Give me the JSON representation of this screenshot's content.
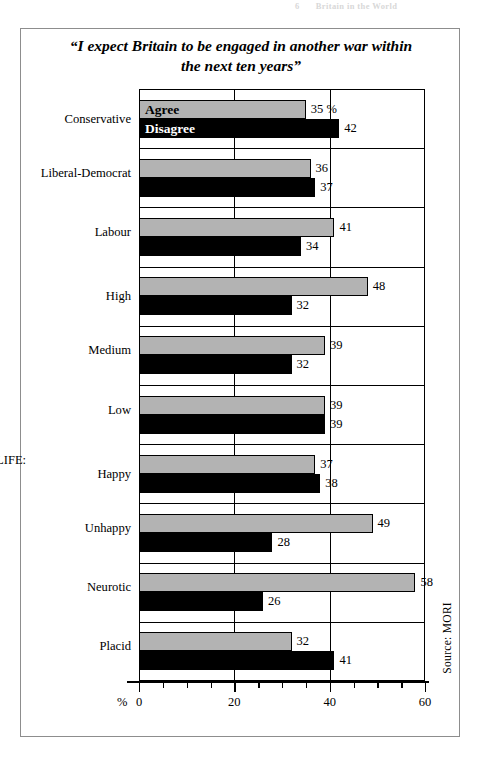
{
  "page_header": {
    "number": "6",
    "text": "Britain in the World"
  },
  "chart": {
    "title": "“I expect Britain to be engaged in another war within the next ten years”",
    "title_line1": "“I expect Britain to be engaged in another war within",
    "title_line2": "the next ten years”",
    "legend_agree": "Agree",
    "legend_disagree": "Disagree",
    "source": "Source: MORI",
    "percent_sign": "%",
    "first_value_suffix": " %"
  },
  "chart_data": {
    "type": "bar",
    "orientation": "horizontal",
    "title": "“I expect Britain to be engaged in another war within the next ten years”",
    "xlabel": "%",
    "ylabel": "",
    "xlim": [
      0,
      60
    ],
    "xticks": [
      0,
      20,
      40,
      60
    ],
    "xtick_labels": [
      "0",
      "20",
      "40",
      "60"
    ],
    "minor_tick_step": 5,
    "grid": true,
    "legend": [
      "Agree",
      "Disagree"
    ],
    "legend_position": "inside-first-bars",
    "colors": {
      "agree": "#b3b3b3",
      "disagree": "#000000",
      "frame": "#000000"
    },
    "groups": [
      {
        "heading": "POLITICS:",
        "categories": [
          "Conservative"
        ]
      },
      {
        "heading": "",
        "categories": [
          "Liberal-Democrat"
        ]
      },
      {
        "heading": "",
        "categories": [
          "Labour"
        ]
      },
      {
        "heading": "INCOME:",
        "categories": [
          "High"
        ]
      },
      {
        "heading": "",
        "categories": [
          "Medium"
        ]
      },
      {
        "heading": "",
        "categories": [
          "Low"
        ]
      },
      {
        "heading": "VIEW OF LIFE:",
        "categories": [
          "Happy"
        ]
      },
      {
        "heading": "",
        "categories": [
          "Unhappy"
        ]
      },
      {
        "heading": "",
        "categories": [
          "Neurotic"
        ]
      },
      {
        "heading": "",
        "categories": [
          "Placid"
        ]
      }
    ],
    "categories": [
      "Conservative",
      "Liberal-Democrat",
      "Labour",
      "High",
      "Medium",
      "Low",
      "Happy",
      "Unhappy",
      "Neurotic",
      "Placid"
    ],
    "series": [
      {
        "name": "Agree",
        "values": [
          35,
          36,
          41,
          48,
          39,
          39,
          37,
          49,
          58,
          32
        ]
      },
      {
        "name": "Disagree",
        "values": [
          42,
          37,
          34,
          32,
          32,
          39,
          38,
          28,
          26,
          41
        ]
      }
    ],
    "rows": [
      {
        "heading": "POLITICS:",
        "label": "Conservative",
        "agree": 35,
        "disagree": 42,
        "agree_text": "35 %",
        "disagree_text": "42",
        "group_start": true
      },
      {
        "heading": "",
        "label": "Liberal-Democrat",
        "agree": 36,
        "disagree": 37,
        "agree_text": "36",
        "disagree_text": "37",
        "group_start": true
      },
      {
        "heading": "",
        "label": "Labour",
        "agree": 41,
        "disagree": 34,
        "agree_text": "41",
        "disagree_text": "34",
        "group_start": true
      },
      {
        "heading": "INCOME:",
        "label": "High",
        "agree": 48,
        "disagree": 32,
        "agree_text": "48",
        "disagree_text": "32",
        "group_start": true
      },
      {
        "heading": "",
        "label": "Medium",
        "agree": 39,
        "disagree": 32,
        "agree_text": "39",
        "disagree_text": "32",
        "group_start": true
      },
      {
        "heading": "",
        "label": "Low",
        "agree": 39,
        "disagree": 39,
        "agree_text": "39",
        "disagree_text": "39",
        "group_start": true
      },
      {
        "heading": "VIEW OF LIFE:",
        "label": "Happy",
        "agree": 37,
        "disagree": 38,
        "agree_text": "37",
        "disagree_text": "38",
        "group_start": true
      },
      {
        "heading": "",
        "label": "Unhappy",
        "agree": 49,
        "disagree": 28,
        "agree_text": "49",
        "disagree_text": "28",
        "group_start": true
      },
      {
        "heading": "",
        "label": "Neurotic",
        "agree": 58,
        "disagree": 26,
        "agree_text": "58",
        "disagree_text": "26",
        "group_start": true
      },
      {
        "heading": "",
        "label": "Placid",
        "agree": 32,
        "disagree": 41,
        "agree_text": "32",
        "disagree_text": "41",
        "group_start": true
      }
    ]
  }
}
